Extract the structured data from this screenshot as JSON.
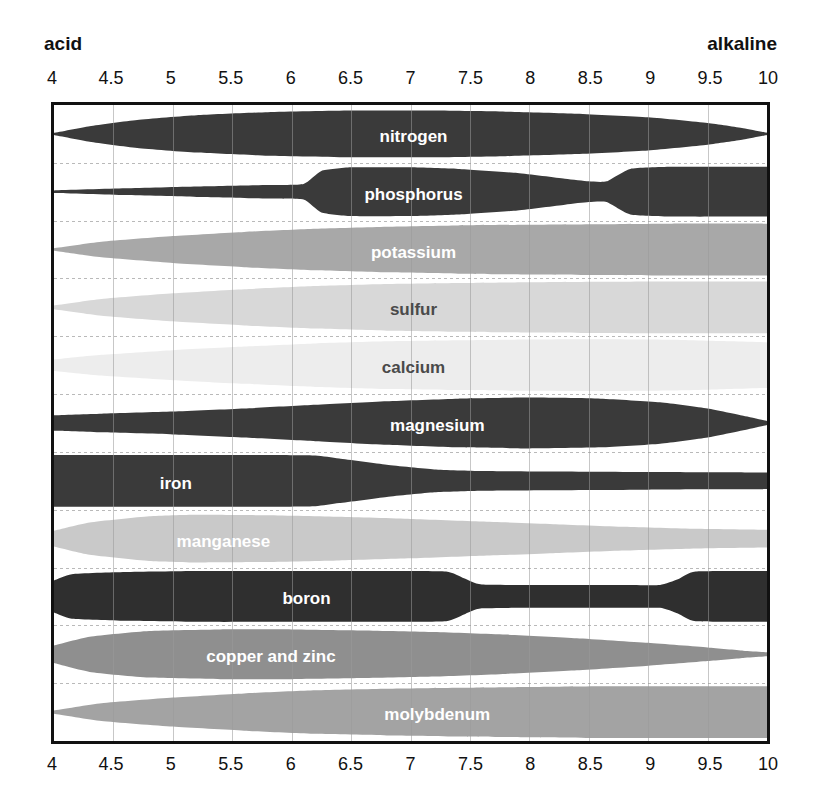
{
  "axis": {
    "acid_label": "acid",
    "alkaline_label": "alkaline",
    "ticks": [
      "4",
      "4.5",
      "5",
      "5.5",
      "6",
      "6.5",
      "7",
      "7.5",
      "8",
      "8.5",
      "9",
      "9.5",
      "10"
    ]
  },
  "colors": {
    "dark": "#3a3a3a",
    "near_black": "#2f2f2f",
    "mid_gray": "#a8a8a8",
    "light_gray": "#d8d8d8",
    "very_light_gray": "#ededed",
    "manganese_gray": "#c9c9c9",
    "copper_gray": "#8f8f8f",
    "molybdenum_gray": "#a3a3a3",
    "border": "#111111",
    "gridline": "#9a9a9a",
    "band_divider": "#b9b9b9",
    "label_light": "#ffffff",
    "label_dark": "#3a3a3a"
  },
  "chart_data": {
    "type": "area",
    "xlabel": "pH",
    "ylabel": "",
    "xlim": [
      4,
      10
    ],
    "grid": true,
    "legend": "none",
    "x_ticks": [
      4,
      4.5,
      5,
      5.5,
      6,
      6.5,
      7,
      7.5,
      8,
      8.5,
      9,
      9.5,
      10
    ],
    "x_annotations": {
      "left": "acid",
      "right": "alkaline"
    },
    "series": [
      {
        "name": "nitrogen",
        "label": "nitrogen",
        "fill": "#3a3a3a",
        "text_color": "#ffffff",
        "label_ph": 7.0,
        "x": [
          4.0,
          4.3,
          4.7,
          5.2,
          5.8,
          6.5,
          7.2,
          7.8,
          8.4,
          9.0,
          9.5,
          9.8,
          10.0
        ],
        "width": [
          0.04,
          0.3,
          0.54,
          0.72,
          0.84,
          0.9,
          0.9,
          0.86,
          0.78,
          0.64,
          0.42,
          0.22,
          0.04
        ]
      },
      {
        "name": "phosphorus",
        "label": "phosphorus",
        "fill": "#3a3a3a",
        "text_color": "#ffffff",
        "label_ph": 7.0,
        "x": [
          4.0,
          4.6,
          5.2,
          5.8,
          6.1,
          6.25,
          6.5,
          7.0,
          7.4,
          7.9,
          8.3,
          8.5,
          8.65,
          8.85,
          9.2,
          10.0
        ],
        "width": [
          0.05,
          0.13,
          0.2,
          0.26,
          0.3,
          0.8,
          0.94,
          0.94,
          0.88,
          0.72,
          0.5,
          0.4,
          0.4,
          0.88,
          0.96,
          0.96
        ]
      },
      {
        "name": "potassium",
        "label": "potassium",
        "fill": "#a8a8a8",
        "text_color": "#ffffff",
        "label_ph": 7.0,
        "x": [
          4.0,
          4.4,
          5.0,
          5.6,
          6.2,
          6.8,
          7.4,
          8.0,
          8.6,
          9.2,
          10.0
        ],
        "width": [
          0.05,
          0.3,
          0.52,
          0.68,
          0.8,
          0.88,
          0.93,
          0.96,
          0.98,
          1.0,
          1.0
        ]
      },
      {
        "name": "sulfur",
        "label": "sulfur",
        "fill": "#d8d8d8",
        "text_color": "#4a4a4a",
        "label_ph": 7.0,
        "x": [
          4.0,
          4.4,
          5.0,
          5.6,
          6.2,
          6.8,
          7.4,
          8.0,
          8.6,
          9.2,
          10.0
        ],
        "width": [
          0.07,
          0.32,
          0.54,
          0.7,
          0.82,
          0.9,
          0.94,
          0.97,
          0.99,
          1.0,
          1.0
        ]
      },
      {
        "name": "calcium",
        "label": "calcium",
        "fill": "#ededed",
        "text_color": "#4a4a4a",
        "label_ph": 7.0,
        "x": [
          4.0,
          4.4,
          5.0,
          5.6,
          6.2,
          6.8,
          7.4,
          8.0,
          8.6,
          9.2,
          9.7,
          10.0
        ],
        "width": [
          0.22,
          0.4,
          0.58,
          0.72,
          0.84,
          0.92,
          0.96,
          0.99,
          1.0,
          0.98,
          0.92,
          0.88
        ]
      },
      {
        "name": "magnesium",
        "label": "magnesium",
        "fill": "#3a3a3a",
        "text_color": "#ffffff",
        "label_ph": 7.2,
        "x": [
          4.0,
          4.4,
          5.0,
          5.6,
          6.2,
          6.8,
          7.4,
          8.0,
          8.6,
          9.1,
          9.5,
          9.8,
          10.0
        ],
        "width": [
          0.3,
          0.36,
          0.44,
          0.56,
          0.7,
          0.84,
          0.94,
          0.98,
          0.94,
          0.8,
          0.56,
          0.28,
          0.08
        ]
      },
      {
        "name": "iron",
        "label": "iron",
        "fill": "#3a3a3a",
        "text_color": "#ffffff",
        "label_ph": 5.0,
        "x": [
          4.0,
          5.0,
          5.8,
          6.2,
          6.4,
          6.8,
          7.2,
          7.6,
          8.2,
          9.0,
          9.6,
          10.0
        ],
        "width": [
          1.0,
          1.0,
          1.0,
          0.98,
          0.86,
          0.62,
          0.44,
          0.38,
          0.36,
          0.34,
          0.33,
          0.32
        ]
      },
      {
        "name": "manganese",
        "label": "manganese",
        "fill": "#c9c9c9",
        "text_color": "#ffffff",
        "label_ph": 5.4,
        "x": [
          4.0,
          4.3,
          4.8,
          5.2,
          5.8,
          6.4,
          7.0,
          7.6,
          8.2,
          8.8,
          9.4,
          10.0
        ],
        "width": [
          0.3,
          0.62,
          0.86,
          0.92,
          0.9,
          0.84,
          0.76,
          0.66,
          0.56,
          0.46,
          0.38,
          0.34
        ]
      },
      {
        "name": "boron",
        "label": "boron",
        "fill": "#2f2f2f",
        "text_color": "#ffffff",
        "label_ph": 6.1,
        "x": [
          4.0,
          4.15,
          4.6,
          5.2,
          6.0,
          6.8,
          7.3,
          7.45,
          7.6,
          8.2,
          8.8,
          9.1,
          9.25,
          9.4,
          10.0
        ],
        "width": [
          0.62,
          0.86,
          0.94,
          0.98,
          0.98,
          0.98,
          0.96,
          0.7,
          0.46,
          0.44,
          0.44,
          0.44,
          0.66,
          0.96,
          0.98
        ]
      },
      {
        "name": "copper and zinc",
        "label": "copper and zinc",
        "fill": "#8f8f8f",
        "text_color": "#ffffff",
        "label_ph": 5.8,
        "x": [
          4.0,
          4.3,
          4.8,
          5.4,
          6.0,
          6.6,
          7.2,
          7.8,
          8.4,
          9.0,
          9.5,
          9.8,
          10.0
        ],
        "width": [
          0.34,
          0.68,
          0.9,
          0.96,
          0.96,
          0.92,
          0.86,
          0.76,
          0.62,
          0.44,
          0.26,
          0.14,
          0.08
        ]
      },
      {
        "name": "molybdenum",
        "label": "molybdenum",
        "fill": "#a3a3a3",
        "text_color": "#ffffff",
        "label_ph": 7.2,
        "x": [
          4.0,
          4.4,
          5.0,
          5.6,
          6.2,
          6.8,
          7.4,
          8.0,
          8.6,
          9.2,
          10.0
        ],
        "width": [
          0.06,
          0.34,
          0.56,
          0.72,
          0.84,
          0.9,
          0.94,
          0.97,
          1.0,
          1.0,
          1.0
        ]
      }
    ]
  }
}
